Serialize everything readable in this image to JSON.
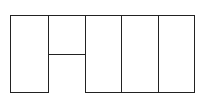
{
  "diagram": {
    "type": "grid-cell-layout",
    "stroke_color": "#222222",
    "background": "#ffffff",
    "bounds": {
      "x1": 10,
      "y1": 15,
      "x2": 194,
      "y2": 92
    },
    "cells": [
      {
        "id": "cell-1",
        "x1": 10,
        "y1": 15,
        "x2": 48,
        "y2": 92
      },
      {
        "id": "cell-2-top",
        "x1": 48,
        "y1": 15,
        "x2": 85,
        "y2": 54
      },
      {
        "id": "cell-2-bottom-open",
        "x1": 48,
        "y1": 54,
        "x2": 85,
        "y2": 92,
        "open_bottom": true
      },
      {
        "id": "cell-3",
        "x1": 85,
        "y1": 15,
        "x2": 121,
        "y2": 92
      },
      {
        "id": "cell-4",
        "x1": 121,
        "y1": 15,
        "x2": 158,
        "y2": 92
      },
      {
        "id": "cell-5",
        "x1": 158,
        "y1": 15,
        "x2": 194,
        "y2": 92
      }
    ]
  }
}
